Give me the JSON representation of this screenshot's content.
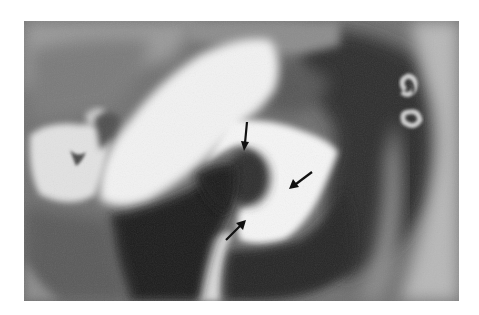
{
  "image": {
    "kind": "radiograph",
    "modality": "contrast (barium) X-ray, grayscale",
    "background_color": "#ffffff",
    "frame": {
      "x": 24,
      "y": 21,
      "width": 435,
      "height": 280
    }
  },
  "annotations": {
    "arrows": [
      {
        "id": "arrow-top",
        "color": "#111111",
        "from": [
          247,
          122
        ],
        "to": [
          244,
          150
        ],
        "direction": "down"
      },
      {
        "id": "arrow-right",
        "color": "#111111",
        "from": [
          312,
          172
        ],
        "to": [
          290,
          188
        ],
        "direction": "down-left"
      },
      {
        "id": "arrow-bottom",
        "color": "#111111",
        "from": [
          226,
          240
        ],
        "to": [
          245,
          221
        ],
        "direction": "up-right"
      }
    ]
  }
}
